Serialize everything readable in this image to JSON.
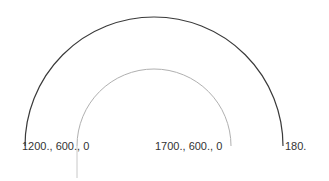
{
  "drawing": {
    "outer_arc": {
      "cx": 154,
      "cy": 146,
      "r": 129,
      "color": "#3a3a3a"
    },
    "inner_arc": {
      "cx": 154,
      "cy": 146,
      "r": 77,
      "color": "#b0b0b0"
    },
    "inner_tail": {
      "x": 77,
      "y1": 146,
      "y2": 178,
      "color": "#c8c8c8"
    }
  },
  "labels": [
    {
      "text": "1200., 600., 0",
      "x": 26,
      "y": 140
    },
    {
      "text": "1700., 600., 0",
      "x": 156,
      "y": 140
    },
    {
      "text": "180.",
      "x": 286,
      "y": 140
    }
  ]
}
